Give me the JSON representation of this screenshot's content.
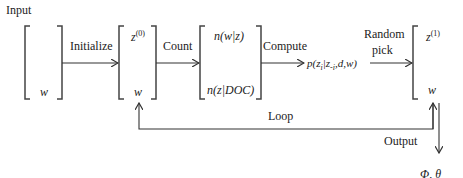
{
  "diagram": {
    "input_label": "Input",
    "output_label": "Output",
    "output_result": "Φ, θ",
    "loop_label": "Loop",
    "steps": [
      {
        "id": "input",
        "top": "",
        "bottom": "w"
      },
      {
        "id": "initial",
        "top": "z",
        "top_sup": "(0)",
        "bottom": "w"
      },
      {
        "id": "counts",
        "top": "n(w|z)",
        "bottom": "n(z|DOC)"
      },
      {
        "id": "updated",
        "top": "z",
        "top_sup": "(1)",
        "bottom": "w"
      }
    ],
    "edges": [
      {
        "from": "input",
        "to": "initial",
        "label": "Initialize"
      },
      {
        "from": "initial",
        "to": "counts",
        "label": "Count"
      },
      {
        "from": "counts",
        "to": "probability",
        "label": "Compute"
      },
      {
        "from": "probability",
        "to": "updated",
        "label": "Random pick",
        "label_line1": "Random",
        "label_line2": "pick"
      },
      {
        "from": "updated",
        "to": "initial",
        "label": "Loop"
      },
      {
        "from": "updated",
        "to": "output",
        "label": "Output"
      }
    ],
    "probability": {
      "p": "p(z",
      "sub1": "i",
      "mid": "|z",
      "sub2": "-i",
      "tail": ",d,w)"
    }
  }
}
